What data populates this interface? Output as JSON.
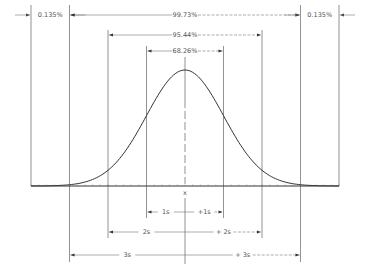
{
  "diagram": {
    "center_label": "x",
    "colors": {
      "line": "#333333",
      "dim": "#777777",
      "text": "#555555",
      "background": "#ffffff"
    },
    "top_annotations": [
      {
        "label": "0.135%",
        "from_sigma": -4,
        "to_sigma": -3,
        "row": 0,
        "style": "outside"
      },
      {
        "label": "99.73%",
        "from_sigma": -3,
        "to_sigma": 3,
        "row": 0,
        "style": "inside"
      },
      {
        "label": "0.135%",
        "from_sigma": 3,
        "to_sigma": 4,
        "row": 0,
        "style": "outside"
      },
      {
        "label": "95.44%",
        "from_sigma": -2,
        "to_sigma": 2,
        "row": 1,
        "style": "inside"
      },
      {
        "label": "68.26%",
        "from_sigma": -1,
        "to_sigma": 1,
        "row": 2,
        "style": "inside"
      }
    ],
    "bottom_annotations": [
      {
        "left_label": "1s",
        "right_label": "+1s",
        "sigma": 1,
        "row": 0
      },
      {
        "left_label": "2s",
        "right_label": "+ 2s",
        "sigma": 2,
        "row": 1
      },
      {
        "left_label": "3s",
        "right_label": "+ 3s",
        "sigma": 3,
        "row": 2
      }
    ],
    "sigma_range": [
      -4,
      4
    ],
    "curve": {
      "type": "gaussian",
      "mean": 0,
      "sd": 1
    }
  }
}
